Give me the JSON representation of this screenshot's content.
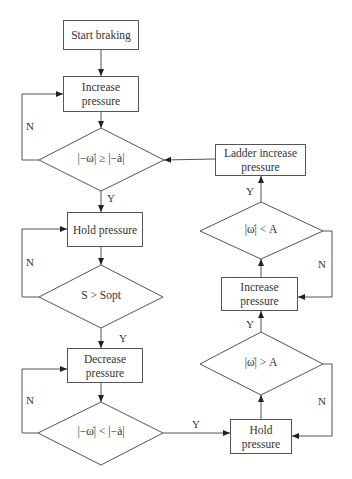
{
  "diagram": {
    "type": "flowchart",
    "boxes": {
      "start": "Start braking",
      "increase1": "Increase pressure",
      "hold1": "Hold pressure",
      "decrease": "Decrease pressure",
      "hold2": "Hold pressure",
      "increase2": "Increase pressure",
      "ladder": "Ladder increase pressure"
    },
    "decisions": {
      "d1": "|−ω̇| ≥ |−ȧ|",
      "d2": "S > Sopt",
      "d3": "|−ω̇| < |−ȧ|",
      "d4": "|ω̇| > A",
      "d5": "|ω̇| < A"
    },
    "edge_labels": {
      "d1_no": "N",
      "d1_yes": "Y",
      "d2_no": "N",
      "d2_yes": "Y",
      "d3_no": "N",
      "d3_yes": "Y",
      "d4_no": "N",
      "d4_yes": "Y",
      "d5_no": "N",
      "d5_yes": "Y"
    },
    "colors": {
      "line": "#555555",
      "text": "#333333",
      "background": "#ffffff"
    }
  }
}
